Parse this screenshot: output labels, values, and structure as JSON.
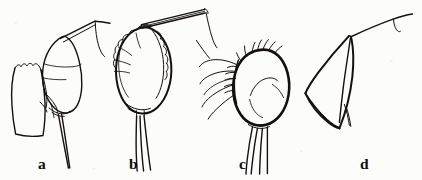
{
  "figure": {
    "kind": "scientific-line-drawing",
    "background_color": "#fcfcfb",
    "ink_color": "#14100d",
    "width": 422,
    "height": 180,
    "panels": [
      {
        "id": "a",
        "label": "a",
        "label_x": 38,
        "label_y": 156,
        "description": "tapered rectangular lobe at left with serrate apical margin, adjacent tilted oval lobe, angular ridge ascending to apex with descending curved seta, two long apical setae descending to lower right"
      },
      {
        "id": "b",
        "label": "b",
        "label_x": 129,
        "label_y": 156,
        "description": "broad oval lobe with scalloped crenulate margins, short setae on upper left margin, pair of long parallel rods ascending to upper right, curved seta descending at right, three long setae descending from base"
      },
      {
        "id": "c",
        "label": "c",
        "label_x": 239,
        "label_y": 156,
        "description": "rounded oval lobe with comb of short bristles along upper left margin, several long wavy setae projecting left, internal curved fold line, four long setae descending from base"
      },
      {
        "id": "d",
        "label": "d",
        "label_x": 360,
        "label_y": 156,
        "description": "conical funnel-shaped lobe widening to lower left with elliptical rim, small tail process at lower right, thin line ascending to upper right with short recurved hook"
      }
    ]
  }
}
